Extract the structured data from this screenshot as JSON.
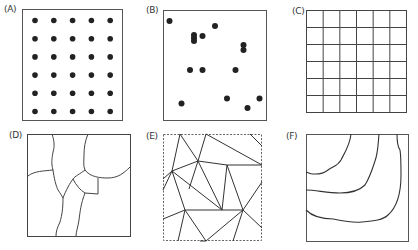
{
  "figure": {
    "panels": [
      {
        "id": "A",
        "label": "(A)",
        "kind": "regular-point-grid",
        "rows": 6,
        "cols": 5
      },
      {
        "id": "B",
        "label": "(B)",
        "kind": "random-points",
        "count": 16
      },
      {
        "id": "C",
        "label": "(C)",
        "kind": "square-grid",
        "rows": 6,
        "cols": 6
      },
      {
        "id": "D",
        "label": "(D)",
        "kind": "irregular-polygons"
      },
      {
        "id": "E",
        "label": "(E)",
        "kind": "triangulated-irregular-network"
      },
      {
        "id": "F",
        "label": "(F)",
        "kind": "contour-lines",
        "count": 3
      }
    ],
    "colors": {
      "line": "#333333",
      "dot": "#222222",
      "background": "#ffffff"
    }
  }
}
